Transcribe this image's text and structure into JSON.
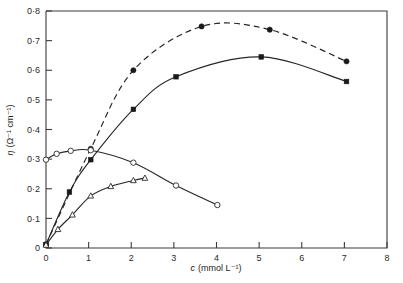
{
  "figure": {
    "background_color": "#ffffff",
    "line_color": "#262626"
  },
  "chart_data": {
    "type": "line",
    "title": "",
    "xlabel": "c (mmol L⁻¹)",
    "xlabel_symbol": "c",
    "xlabel_units": "(mmol L⁻¹)",
    "ylabel": "η (Ω⁻¹ cm⁻¹)",
    "ylabel_symbol": "η",
    "ylabel_units": "(Ω⁻¹ cm⁻¹)",
    "xlim": [
      0,
      8
    ],
    "ylim": [
      0,
      0.8
    ],
    "grid": false,
    "legend_position": "none",
    "xticks": [
      0,
      1,
      2,
      3,
      4,
      5,
      6,
      7,
      8
    ],
    "xticklabels": [
      "0",
      "1",
      "2",
      "3",
      "4",
      "5",
      "6",
      "7",
      "8"
    ],
    "yticks": [
      0,
      0.1,
      0.2,
      0.3,
      0.4,
      0.5,
      0.6,
      0.7,
      0.8
    ],
    "yticklabels": [
      "0",
      "0·1",
      "0·2",
      "0·3",
      "0·4",
      "0·5",
      "0·6",
      "0·7",
      "0·8"
    ],
    "series": [
      {
        "name": "filled-circle-dashed",
        "marker": "filled-circle",
        "linestyle": "dashed",
        "x": [
          0.0,
          1.05,
          2.05,
          3.65,
          5.25,
          7.05
        ],
        "y": [
          0.012,
          0.335,
          0.6,
          0.748,
          0.737,
          0.63
        ]
      },
      {
        "name": "filled-square-solid",
        "marker": "filled-square",
        "linestyle": "solid",
        "x": [
          0.0,
          0.55,
          1.05,
          2.05,
          3.05,
          5.05,
          7.05
        ],
        "y": [
          0.012,
          0.189,
          0.298,
          0.468,
          0.578,
          0.645,
          0.562
        ]
      },
      {
        "name": "open-circle-solid",
        "marker": "open-circle",
        "linestyle": "solid",
        "x": [
          0.0,
          0.25,
          0.58,
          1.05,
          2.05,
          3.05,
          4.02
        ],
        "y": [
          0.298,
          0.318,
          0.328,
          0.33,
          0.288,
          0.211,
          0.145
        ]
      },
      {
        "name": "open-triangle-solid",
        "marker": "open-triangle",
        "linestyle": "solid",
        "x": [
          0.0,
          0.28,
          0.62,
          1.05,
          1.52,
          2.05,
          2.32
        ],
        "y": [
          0.01,
          0.063,
          0.112,
          0.176,
          0.208,
          0.228,
          0.236
        ]
      }
    ]
  }
}
